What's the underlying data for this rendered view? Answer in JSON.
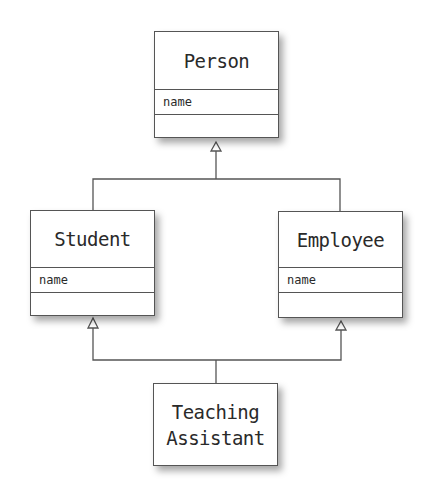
{
  "diagram": {
    "type": "UML class diagram (multiple inheritance)",
    "classes": [
      {
        "id": "person",
        "name": "Person",
        "attributes": [
          "name"
        ],
        "operations": []
      },
      {
        "id": "student",
        "name": "Student",
        "attributes": [
          "name"
        ],
        "operations": []
      },
      {
        "id": "employee",
        "name": "Employee",
        "attributes": [
          "name"
        ],
        "operations": []
      },
      {
        "id": "ta",
        "name": "Teaching Assistant",
        "name_lines": [
          "Teaching",
          "Assistant"
        ],
        "attributes": [],
        "operations": []
      }
    ],
    "relationships": [
      {
        "type": "generalization",
        "from": "Student",
        "to": "Person"
      },
      {
        "type": "generalization",
        "from": "Employee",
        "to": "Person"
      },
      {
        "type": "generalization",
        "from": "Teaching Assistant",
        "to": "Student"
      },
      {
        "type": "generalization",
        "from": "Teaching Assistant",
        "to": "Employee"
      }
    ],
    "colors": {
      "line": "#555555",
      "box_fill": "#ffffff",
      "text": "#2a2a2a"
    }
  }
}
